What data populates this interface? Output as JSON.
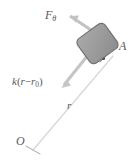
{
  "figure": {
    "background_color": "#ffffff",
    "width": 135,
    "height": 162,
    "colors": {
      "block_fill": "#9d9d9d",
      "block_stroke": "#6e6e6e",
      "arrow": "#c2c2c2",
      "thin_line": "#d8d8d8",
      "text": "#59585c",
      "tick": "#3a3a3a"
    },
    "labels": {
      "tangential_force": "F",
      "tangential_force_sub": "θ",
      "block": "A",
      "spring_force_k": "k",
      "spring_force_open": "(",
      "spring_force_r": "r",
      "spring_force_minus": "−",
      "spring_force_r0": "r",
      "spring_force_r0_sub": "0",
      "spring_force_close": ")",
      "radius": "r",
      "origin": "O"
    },
    "elements": [
      {
        "name": "block-a",
        "type": "rounded-rect",
        "rotation_deg": -36,
        "description": "gray rounded rectangle representing block A"
      },
      {
        "name": "tangential-force-arrow",
        "type": "arrow",
        "direction": "up-left",
        "label": "Fθ"
      },
      {
        "name": "spring-force-arrow",
        "type": "arrow",
        "direction": "down-left",
        "label": "k(r − r0)"
      },
      {
        "name": "radial-line",
        "type": "line",
        "from": "O",
        "to": "block A",
        "label": "r"
      },
      {
        "name": "origin-tick",
        "type": "tick",
        "description": "perpendicular tick mark at origin end of radial line"
      },
      {
        "name": "block-tick",
        "type": "tick",
        "description": "small perpendicular tick mark near block on radial line"
      }
    ]
  }
}
